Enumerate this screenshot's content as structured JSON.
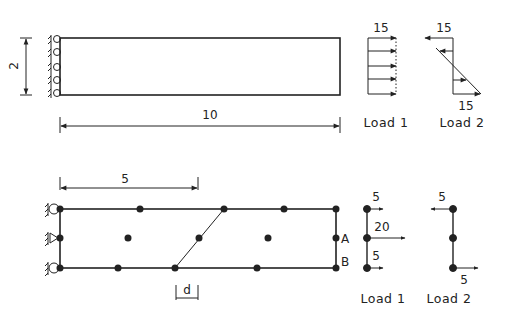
{
  "top_model": {
    "dimensions": {
      "height_label": "2",
      "width_label": "10"
    },
    "load_1": {
      "label": "Load 1",
      "magnitude": "15",
      "distribution": "uniform"
    },
    "load_2": {
      "label": "Load 2",
      "magnitude_top": "15",
      "magnitude_bottom": "15",
      "distribution": "linear (bending)"
    }
  },
  "bottom_model": {
    "dimensions": {
      "half_length_label": "5",
      "distortion_label": "d"
    },
    "node_labels": {
      "a": "A",
      "b": "B"
    },
    "load_1": {
      "label": "Load 1",
      "top": "5",
      "middle": "20",
      "bottom": "5"
    },
    "load_2": {
      "label": "Load 2",
      "top": "5",
      "bottom": "5"
    }
  },
  "colors": {
    "ink": "#222222",
    "background": "#ffffff"
  }
}
